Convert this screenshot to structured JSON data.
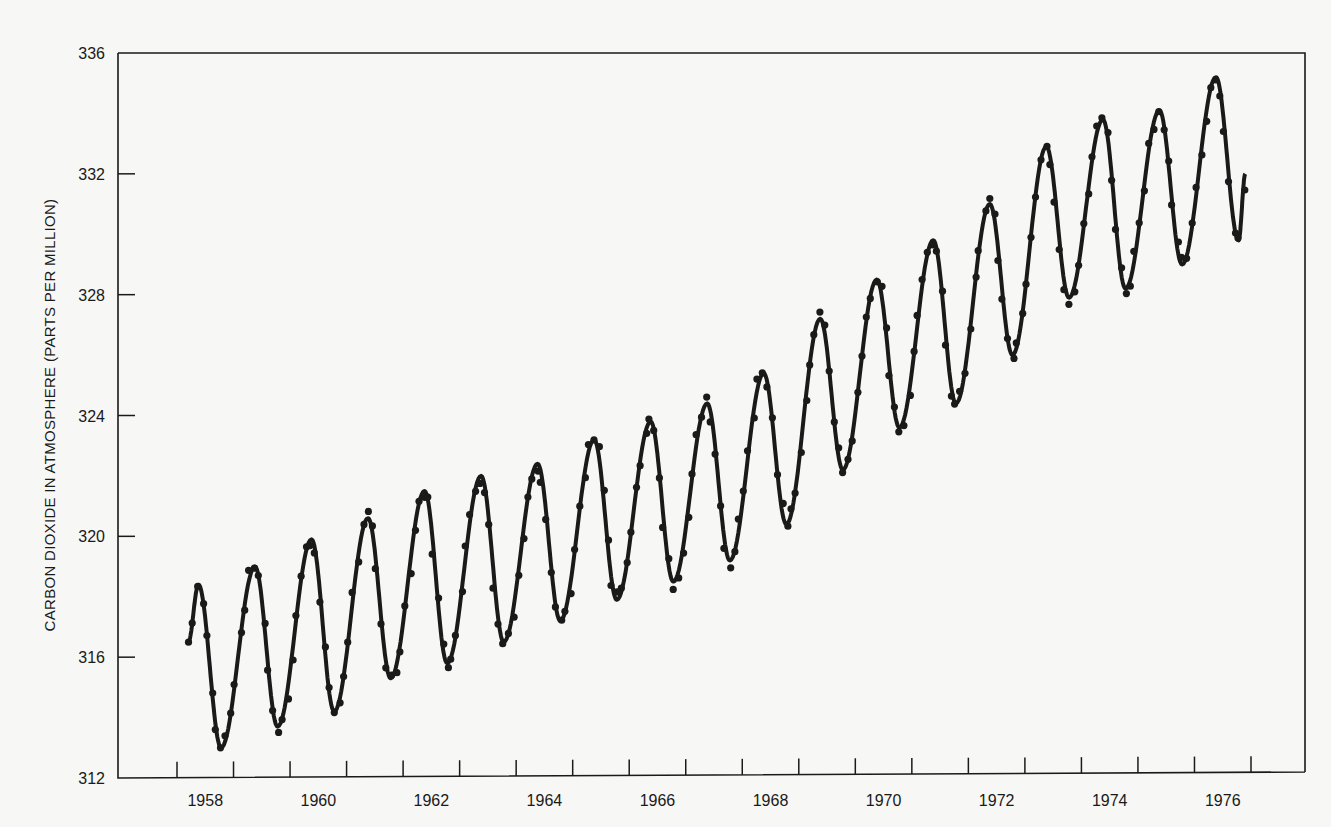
{
  "chart_data": {
    "type": "line",
    "title": "",
    "xlabel": "",
    "ylabel": "CARBON DIOXIDE IN ATMOSPHERE (PARTS PER MILLION)",
    "xlim": [
      1958.0,
      1977.0
    ],
    "ylim": [
      312,
      336
    ],
    "yticks": [
      312,
      316,
      320,
      324,
      328,
      332,
      336
    ],
    "xtick_labels": [
      "1958",
      "1960",
      "1962",
      "1964",
      "1966",
      "1968",
      "1970",
      "1972",
      "1974",
      "1976"
    ],
    "grid": false,
    "legend": null,
    "series": [
      {
        "name": "Monthly CO2 (dots) with fitted seasonal curve (line)",
        "annual_peaks": {
          "years": [
            1958,
            1959,
            1960,
            1961,
            1962,
            1963,
            1964,
            1965,
            1966,
            1967,
            1968,
            1969,
            1970,
            1971,
            1972,
            1973,
            1974,
            1975,
            1976
          ],
          "peak_ppm": [
            318.4,
            319.0,
            319.9,
            320.6,
            321.5,
            322.0,
            322.4,
            323.2,
            323.8,
            324.4,
            325.4,
            327.2,
            328.5,
            329.8,
            331.0,
            332.9,
            333.8,
            334.1,
            335.2
          ],
          "trough_ppm": [
            313.0,
            313.7,
            314.2,
            315.3,
            315.8,
            316.5,
            317.2,
            317.9,
            318.5,
            319.2,
            320.4,
            322.2,
            323.6,
            324.4,
            326.0,
            327.9,
            328.2,
            329.0,
            329.8
          ]
        },
        "start": {
          "x": 1958.2,
          "y": 316.5
        },
        "end": {
          "x": 1976.9,
          "y": 332.0
        }
      }
    ]
  },
  "axes": {
    "y_title": "CARBON DIOXIDE IN ATMOSPHERE (PARTS PER MILLION)"
  },
  "colors": {
    "ink": "#1a1a1a",
    "paper": "#f7f7f5"
  }
}
